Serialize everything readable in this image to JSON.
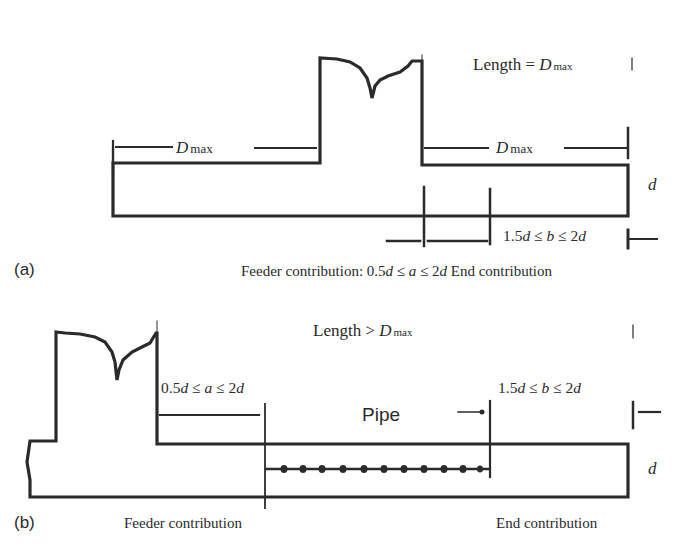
{
  "panel_a": {
    "label": "(a)",
    "length_text": "Length = ",
    "length_var": "D",
    "length_sub": "max",
    "dmax_left_var": "D",
    "dmax_left_sub": "max",
    "dmax_right_var": "D",
    "dmax_right_sub": "max",
    "thickness_label": "d",
    "b_range": {
      "p1": "1.5",
      "v1": "d",
      "op1": " ≤ ",
      "v2": "b",
      "op2": " ≤ 2",
      "v3": "d"
    },
    "caption_feeder": "Feeder contribution: ",
    "a_range": {
      "p1": "0.5",
      "v1": "d",
      "op1": " ≤ ",
      "v2": "a",
      "op2": " ≤ 2",
      "v3": "d"
    },
    "caption_end": " End contribution"
  },
  "panel_b": {
    "label": "(b)",
    "length_text": "Length > ",
    "length_var": "D",
    "length_sub": "max",
    "a_range": {
      "p1": "0.5",
      "v1": "d",
      "op1": " ≤ ",
      "v2": "a",
      "op2": " ≤ 2",
      "v3": "d"
    },
    "b_range": {
      "p1": "1.5",
      "v1": "d",
      "op1": " ≤ ",
      "v2": "b",
      "op2": " ≤ 2",
      "v3": "d"
    },
    "pipe_label": "Pipe",
    "thickness_label": "d",
    "feeder_caption": "Feeder contribution",
    "end_caption": "End contribution"
  },
  "colors": {
    "line": "#2b2b2b",
    "background": "#ffffff"
  }
}
